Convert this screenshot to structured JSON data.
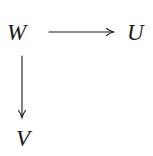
{
  "diagram": {
    "type": "commutative-diagram",
    "nodes": [
      {
        "id": "W",
        "label": "W",
        "position": "top-left"
      },
      {
        "id": "U",
        "label": "U",
        "position": "top-right"
      },
      {
        "id": "V",
        "label": "V",
        "position": "bottom-left"
      }
    ],
    "edges": [
      {
        "from": "W",
        "to": "U",
        "direction": "right",
        "label": ""
      },
      {
        "from": "W",
        "to": "V",
        "direction": "down",
        "label": ""
      }
    ],
    "colors": {
      "ink": "#1a1a1a",
      "background": "#ffffff"
    }
  }
}
